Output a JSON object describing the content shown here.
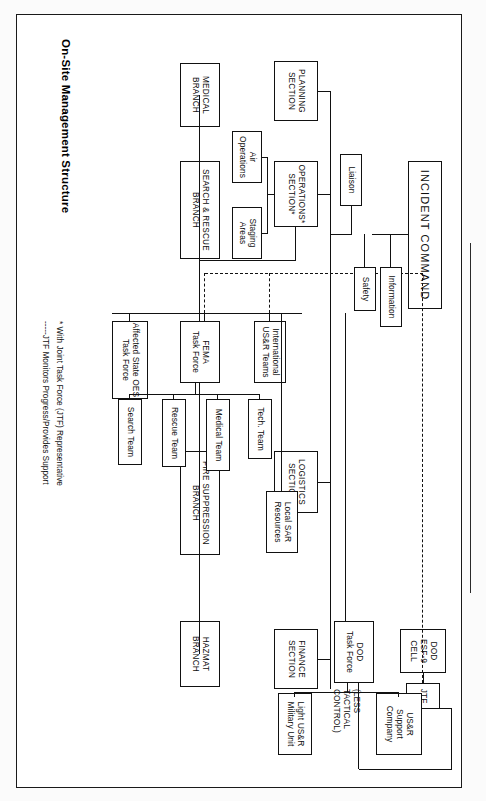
{
  "title": "On-Site Management Structure",
  "annotation": "(LESS\nTACTICAL\nCONTROL)",
  "footnotes": [
    "* With Joint Task Force (JTF) Representative",
    "-----JTF Monitors Progress/Provides Support"
  ],
  "nodes": {
    "incident_command": "INCIDENT COMMAND",
    "liaison": "Liaison",
    "information": "Information",
    "safety": "Safety",
    "dod_esf9_cell": "DOD\nESF-9\nCELL",
    "jtf": "JTF",
    "planning_section": "PLANNING\nSECTION",
    "operations_section": "OPERATIONS*\nSECTION*",
    "logistics_section": "LOGISTICS\nSECTION",
    "finance_section": "FINANCE\nSECTION",
    "air_operations": "Air\nOperations",
    "staging_areas": "Staging\nAreas",
    "medical_branch": "MEDICAL\nBRANCH",
    "search_rescue_branch": "SEARCH & RESCUE\nBRANCH",
    "fire_suppression_branch": "FIRE SUPPRESSION\nBRANCH",
    "hazmat_branch": "HAZMAT\nBRANCH",
    "affected_state_oes": "Affected State OES\nTask Force",
    "fema_task_force": "FEMA\nTask Force",
    "international_usr": "International\nUS&R Teams",
    "local_sar": "Local SAR\nResources",
    "dod_task_force": "DOD\nTask Force",
    "search_team": "Search Team",
    "rescue_team": "Rescue Team",
    "medical_team": "Medical Team",
    "tech_team": "Tech. Team",
    "light_usr_military_unit": "Light US&R\nMilitary Unit",
    "usr_support_company": "US&R\nSupport\nCompany"
  },
  "operations_label_line1": "OPERATIONS*",
  "operations_label_line2": "SECTION*",
  "colors": {
    "ink": "#111111",
    "paper": "#ffffff"
  }
}
